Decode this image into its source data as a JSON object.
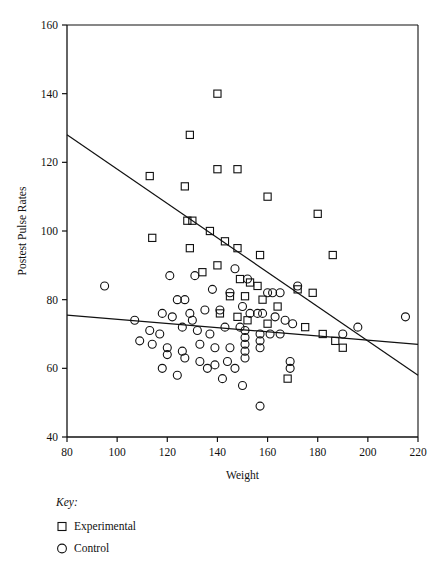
{
  "figure": {
    "width": 447,
    "height": 578,
    "background": "#ffffff",
    "ink": "#111111"
  },
  "ghost_text": {
    "top": "",
    "bottom": ""
  },
  "axes": {
    "x": {
      "label": "Weight",
      "min": 80,
      "max": 220,
      "ticks": [
        80,
        100,
        120,
        140,
        160,
        180,
        200,
        220
      ],
      "tick_labels": [
        "80",
        "100",
        "120",
        "140",
        "160",
        "180",
        "200",
        "220"
      ]
    },
    "y": {
      "label": "Postest Pulse Rates",
      "min": 40,
      "max": 160,
      "ticks": [
        40,
        60,
        80,
        100,
        120,
        140,
        160
      ],
      "tick_labels": [
        "40",
        "60",
        "80",
        "100",
        "120",
        "140",
        "160"
      ]
    }
  },
  "legend": {
    "title": "Key:",
    "entries": [
      {
        "marker": "square",
        "label": "Experimental"
      },
      {
        "marker": "circle",
        "label": "Control"
      }
    ]
  },
  "chart_data": {
    "type": "scatter",
    "title": "",
    "xlabel": "Weight",
    "ylabel": "Postest Pulse Rates",
    "xlim": [
      80,
      220
    ],
    "ylim": [
      40,
      160
    ],
    "grid": false,
    "legend_position": "below-left",
    "marker_colors": {
      "experimental": "#333333",
      "control": "#333333"
    },
    "series": [
      {
        "name": "Experimental",
        "marker": "square",
        "points": [
          [
            140,
            140
          ],
          [
            129,
            128
          ],
          [
            113,
            116
          ],
          [
            127,
            113
          ],
          [
            140,
            118
          ],
          [
            148,
            118
          ],
          [
            160,
            110
          ],
          [
            180,
            105
          ],
          [
            114,
            98
          ],
          [
            128,
            103
          ],
          [
            130,
            103
          ],
          [
            137,
            100
          ],
          [
            129,
            95
          ],
          [
            143,
            97
          ],
          [
            148,
            95
          ],
          [
            157,
            93
          ],
          [
            186,
            93
          ],
          [
            140,
            90
          ],
          [
            134,
            88
          ],
          [
            149,
            86
          ],
          [
            153,
            85
          ],
          [
            156,
            84
          ],
          [
            172,
            83
          ],
          [
            178,
            82
          ],
          [
            145,
            81
          ],
          [
            151,
            81
          ],
          [
            158,
            80
          ],
          [
            164,
            78
          ],
          [
            141,
            76
          ],
          [
            148,
            75
          ],
          [
            152,
            74
          ],
          [
            160,
            73
          ],
          [
            175,
            72
          ],
          [
            182,
            70
          ],
          [
            187,
            68
          ],
          [
            190,
            66
          ],
          [
            168,
            57
          ]
        ]
      },
      {
        "name": "Control",
        "marker": "circle",
        "points": [
          [
            95,
            84
          ],
          [
            121,
            87
          ],
          [
            131,
            87
          ],
          [
            147,
            89
          ],
          [
            152,
            86
          ],
          [
            138,
            83
          ],
          [
            145,
            82
          ],
          [
            160,
            82
          ],
          [
            162,
            82
          ],
          [
            165,
            82
          ],
          [
            172,
            84
          ],
          [
            124,
            80
          ],
          [
            127,
            80
          ],
          [
            118,
            76
          ],
          [
            122,
            75
          ],
          [
            107,
            74
          ],
          [
            129,
            76
          ],
          [
            130,
            74
          ],
          [
            135,
            77
          ],
          [
            141,
            77
          ],
          [
            150,
            78
          ],
          [
            153,
            76
          ],
          [
            156,
            76
          ],
          [
            158,
            76
          ],
          [
            163,
            75
          ],
          [
            167,
            74
          ],
          [
            170,
            73
          ],
          [
            113,
            71
          ],
          [
            117,
            70
          ],
          [
            126,
            72
          ],
          [
            132,
            71
          ],
          [
            137,
            70
          ],
          [
            143,
            72
          ],
          [
            149,
            72
          ],
          [
            151,
            71
          ],
          [
            151,
            69
          ],
          [
            151,
            67
          ],
          [
            151,
            65
          ],
          [
            151,
            63
          ],
          [
            157,
            70
          ],
          [
            157,
            68
          ],
          [
            157,
            66
          ],
          [
            161,
            70
          ],
          [
            165,
            70
          ],
          [
            109,
            68
          ],
          [
            114,
            67
          ],
          [
            120,
            66
          ],
          [
            120,
            64
          ],
          [
            126,
            65
          ],
          [
            127,
            63
          ],
          [
            133,
            62
          ],
          [
            139,
            61
          ],
          [
            144,
            62
          ],
          [
            147,
            60
          ],
          [
            118,
            60
          ],
          [
            124,
            58
          ],
          [
            136,
            60
          ],
          [
            142,
            57
          ],
          [
            150,
            55
          ],
          [
            157,
            49
          ],
          [
            169,
            62
          ],
          [
            169,
            60
          ],
          [
            215,
            75
          ],
          [
            190,
            70
          ],
          [
            196,
            72
          ],
          [
            145,
            66
          ],
          [
            139,
            66
          ],
          [
            133,
            67
          ]
        ]
      }
    ],
    "trend_lines": [
      {
        "name": "Experimental fit",
        "x0": 80,
        "y0": 128,
        "x1": 220,
        "y1": 58
      },
      {
        "name": "Control fit",
        "x0": 80,
        "y0": 75.5,
        "x1": 220,
        "y1": 67
      }
    ]
  }
}
